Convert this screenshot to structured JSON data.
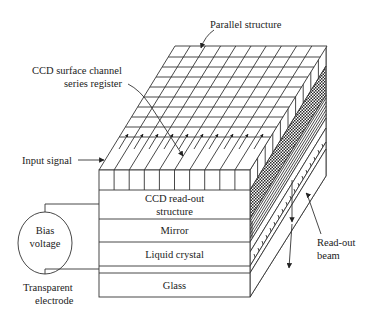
{
  "diagram": {
    "labels": {
      "parallel_structure": "Parallel structure",
      "ccd_register_line1": "CCD surface channel",
      "ccd_register_line2": "series register",
      "input_signal": "Input signal",
      "bias_line1": "Bias",
      "bias_line2": "voltage",
      "transparent_line1": "Transparent",
      "transparent_line2": "electrode",
      "readout_line1": "Read-out",
      "readout_line2": "beam"
    },
    "layers": [
      {
        "id": "ccd-readout",
        "line1": "CCD read-out",
        "line2": "structure"
      },
      {
        "id": "mirror",
        "line1": "Mirror"
      },
      {
        "id": "liquid-crystal",
        "line1": "Liquid crystal"
      },
      {
        "id": "transparent-electrode",
        "line1": ""
      },
      {
        "id": "glass",
        "line1": "Glass"
      }
    ],
    "colors": {
      "line": "#333333",
      "background": "#ffffff",
      "checker": "#2a2a2a"
    }
  }
}
